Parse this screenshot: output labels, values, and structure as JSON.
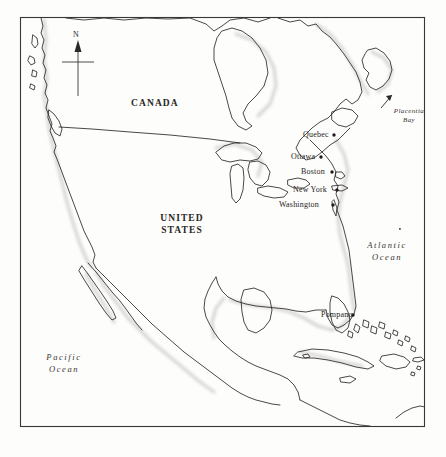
{
  "figure": {
    "kind": "map",
    "title_visible": false,
    "background_color": "#fdfdfc",
    "ink_color": "#262320",
    "frame": {
      "x": 20,
      "y": 17,
      "width": 405,
      "height": 410,
      "stroke": "#3a3733"
    }
  },
  "compass": {
    "label": "N",
    "name": "north-arrow"
  },
  "countries": [
    {
      "name": "canada",
      "label": "CANADA",
      "x": 131,
      "y": 97
    },
    {
      "name": "united-states",
      "label": "UNITED\nSTATES",
      "line1": "UNITED",
      "line2": "STATES",
      "x": 152,
      "y": 212
    }
  ],
  "oceans": [
    {
      "name": "atlantic-ocean",
      "line1": "Atlantic",
      "line2": "Ocean",
      "x": 359,
      "y": 239
    },
    {
      "name": "pacific-ocean",
      "line1": "Pacific",
      "line2": "Ocean",
      "x": 38,
      "y": 351
    }
  ],
  "bays": [
    {
      "name": "placentia-bay",
      "line1": "Placentia",
      "line2": "Bay",
      "x": 394,
      "y": 109,
      "has_arrow": true
    }
  ],
  "cities": [
    {
      "name": "quebec",
      "label": "Quebec",
      "label_x": 303,
      "label_y": 131,
      "dot_x": 334,
      "dot_y": 135,
      "anchor": "right"
    },
    {
      "name": "ottawa",
      "label": "Ottawa",
      "label_x": 291,
      "label_y": 153,
      "dot_x": 321,
      "dot_y": 157,
      "anchor": "right"
    },
    {
      "name": "boston",
      "label": "Boston",
      "label_x": 301,
      "label_y": 168,
      "dot_x": 332,
      "dot_y": 172,
      "anchor": "right"
    },
    {
      "name": "new-york",
      "label": "New York",
      "label_x": 293,
      "label_y": 186,
      "dot_x": 335,
      "dot_y": 190,
      "anchor": "right"
    },
    {
      "name": "washington",
      "label": "Washington",
      "label_x": 281,
      "label_y": 201,
      "dot_x": 331,
      "dot_y": 205,
      "anchor": "right"
    },
    {
      "name": "pompano",
      "label": "Pompano",
      "label_x": 322,
      "label_y": 311,
      "dot_x": 353,
      "dot_y": 315,
      "anchor": "right"
    }
  ],
  "legend": {
    "present": false
  }
}
